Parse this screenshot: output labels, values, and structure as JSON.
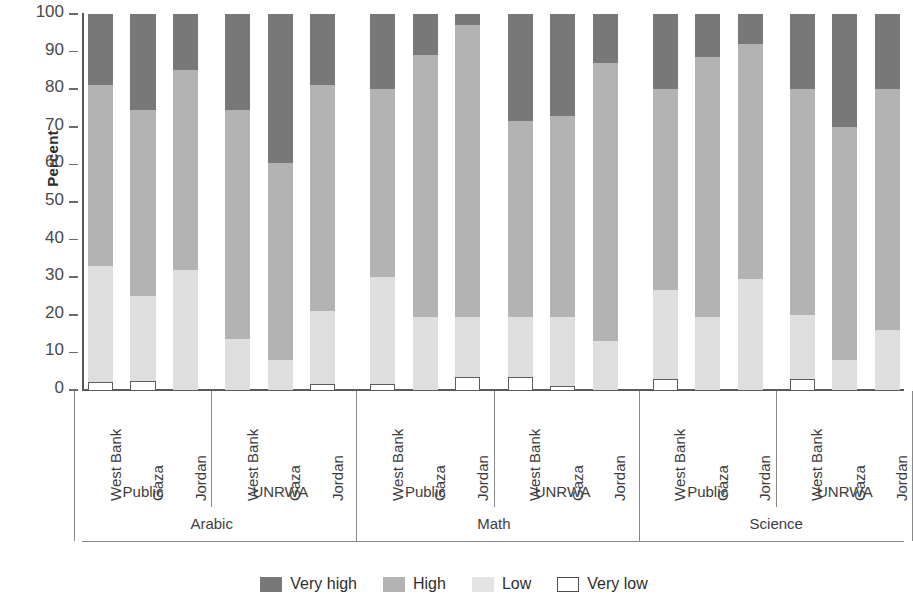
{
  "axis": {
    "y_title": "Percent",
    "y_ticks": [
      "0",
      "10",
      "20",
      "30",
      "40",
      "50",
      "60",
      "70",
      "80",
      "90",
      "100"
    ],
    "y_min": 0,
    "y_max": 100
  },
  "legend": {
    "items": [
      {
        "label": "Very high",
        "swatch": "dark-gray-swatch",
        "color": "#787878"
      },
      {
        "label": "High",
        "swatch": "medium-gray-swatch",
        "color": "#b3b3b3"
      },
      {
        "label": "Low",
        "swatch": "light-gray-swatch",
        "color": "#e3e3e3"
      },
      {
        "label": "Very low",
        "swatch": "white-outline-swatch",
        "color": "#ffffff"
      }
    ]
  },
  "subjects": [
    {
      "label": "Arabic"
    },
    {
      "label": "Math"
    },
    {
      "label": "Science"
    }
  ],
  "sectors": [
    {
      "label": "Public"
    },
    {
      "label": "UNRWA"
    }
  ],
  "countries": [
    {
      "label": "West Bank"
    },
    {
      "label": "Gaza"
    },
    {
      "label": "Jordan"
    }
  ],
  "chart_data": {
    "type": "bar",
    "subtype": "stacked-100-percent",
    "title": "",
    "xlabel": "",
    "ylabel": "Percent",
    "ylim": [
      0,
      100
    ],
    "grid": false,
    "legend_position": "bottom-center",
    "series": [
      {
        "name": "Very low",
        "color": "#ffffff",
        "values": [
          2,
          2.5,
          0,
          0,
          0,
          1.5,
          1.5,
          0,
          3.5,
          3.5,
          1,
          0,
          3,
          0,
          0,
          3,
          0,
          0
        ]
      },
      {
        "name": "Low",
        "color": "#e3e3e3",
        "values": [
          31,
          22.5,
          32,
          13.5,
          8,
          19.5,
          28.5,
          19.5,
          16,
          16,
          18.5,
          13,
          23.5,
          19.5,
          29.5,
          17,
          8,
          16
        ]
      },
      {
        "name": "High",
        "color": "#b3b3b3",
        "values": [
          48,
          49.5,
          53,
          61,
          52.5,
          60,
          50,
          69.5,
          77.5,
          52,
          53.5,
          74,
          53.5,
          69,
          62.5,
          60,
          62,
          64
        ]
      },
      {
        "name": "Very high",
        "color": "#787878",
        "values": [
          19,
          25.5,
          15,
          25.5,
          39.5,
          19,
          20,
          11,
          3,
          28.5,
          27,
          13,
          20,
          11.5,
          8,
          20,
          30,
          20
        ]
      }
    ],
    "categories": [
      {
        "subject": "Arabic",
        "sector": "Public",
        "country": "West Bank",
        "very_low": 2,
        "low": 31,
        "high": 48,
        "very_high": 19,
        "cum": [
          2,
          33,
          81,
          100
        ]
      },
      {
        "subject": "Arabic",
        "sector": "Public",
        "country": "Gaza",
        "very_low": 2.5,
        "low": 22.5,
        "high": 49.5,
        "very_high": 25.5,
        "cum": [
          2.5,
          25,
          74.5,
          100
        ]
      },
      {
        "subject": "Arabic",
        "sector": "Public",
        "country": "Jordan",
        "very_low": 0,
        "low": 32,
        "high": 53,
        "very_high": 15,
        "cum": [
          0,
          32,
          85,
          100
        ]
      },
      {
        "subject": "Arabic",
        "sector": "UNRWA",
        "country": "West Bank",
        "very_low": 0,
        "low": 13.5,
        "high": 61,
        "very_high": 25.5,
        "cum": [
          0,
          13.5,
          74.5,
          100
        ]
      },
      {
        "subject": "Arabic",
        "sector": "UNRWA",
        "country": "Gaza",
        "very_low": 0,
        "low": 8,
        "high": 52.5,
        "very_high": 39.5,
        "cum": [
          0,
          8,
          60.5,
          100
        ]
      },
      {
        "subject": "Arabic",
        "sector": "UNRWA",
        "country": "Jordan",
        "very_low": 1.5,
        "low": 19.5,
        "high": 60,
        "very_high": 19,
        "cum": [
          1.5,
          21,
          81,
          100
        ]
      },
      {
        "subject": "Math",
        "sector": "Public",
        "country": "West Bank",
        "very_low": 1.5,
        "low": 28.5,
        "high": 50,
        "very_high": 20,
        "cum": [
          1.5,
          30,
          80,
          100
        ]
      },
      {
        "subject": "Math",
        "sector": "Public",
        "country": "Gaza",
        "very_low": 0,
        "low": 19.5,
        "high": 69.5,
        "very_high": 11,
        "cum": [
          0,
          19.5,
          89,
          100
        ]
      },
      {
        "subject": "Math",
        "sector": "Public",
        "country": "Jordan",
        "very_low": 3.5,
        "low": 16,
        "high": 77.5,
        "very_high": 3,
        "cum": [
          3.5,
          19.5,
          97,
          100
        ]
      },
      {
        "subject": "Math",
        "sector": "UNRWA",
        "country": "West Bank",
        "very_low": 3.5,
        "low": 16,
        "high": 52,
        "very_high": 28.5,
        "cum": [
          3.5,
          19.5,
          71.5,
          100
        ]
      },
      {
        "subject": "Math",
        "sector": "UNRWA",
        "country": "Gaza",
        "very_low": 1,
        "low": 18.5,
        "high": 53.5,
        "very_high": 27,
        "cum": [
          1,
          19.5,
          73,
          100
        ]
      },
      {
        "subject": "Math",
        "sector": "UNRWA",
        "country": "Jordan",
        "very_low": 0,
        "low": 13,
        "high": 74,
        "very_high": 13,
        "cum": [
          0,
          13,
          87,
          100
        ]
      },
      {
        "subject": "Science",
        "sector": "Public",
        "country": "West Bank",
        "very_low": 3,
        "low": 23.5,
        "high": 53.5,
        "very_high": 20,
        "cum": [
          3,
          26.5,
          80,
          100
        ]
      },
      {
        "subject": "Science",
        "sector": "Public",
        "country": "Gaza",
        "very_low": 0,
        "low": 19.5,
        "high": 69,
        "very_high": 11.5,
        "cum": [
          0,
          19.5,
          88.5,
          100
        ]
      },
      {
        "subject": "Science",
        "sector": "Public",
        "country": "Jordan",
        "very_low": 0,
        "low": 29.5,
        "high": 62.5,
        "very_high": 8,
        "cum": [
          0,
          29.5,
          92,
          100
        ]
      },
      {
        "subject": "Science",
        "sector": "UNRWA",
        "country": "West Bank",
        "very_low": 3,
        "low": 17,
        "high": 60,
        "very_high": 20,
        "cum": [
          3,
          20,
          80,
          100
        ]
      },
      {
        "subject": "Science",
        "sector": "UNRWA",
        "country": "Gaza",
        "very_low": 0,
        "low": 8,
        "high": 62,
        "very_high": 30,
        "cum": [
          0,
          8,
          70,
          100
        ]
      },
      {
        "subject": "Science",
        "sector": "UNRWA",
        "country": "Jordan",
        "very_low": 0,
        "low": 16,
        "high": 64,
        "very_high": 20,
        "cum": [
          0,
          16,
          80,
          100
        ]
      }
    ]
  }
}
